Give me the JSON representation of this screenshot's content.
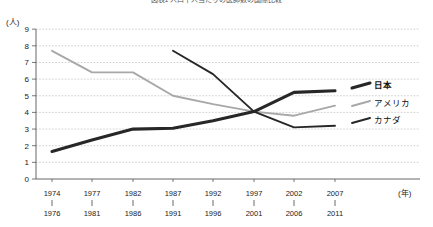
{
  "title": "図表1 人口千人当たりの医師数の国際比較",
  "axis": {
    "y_unit": "(人)",
    "x_unit": "(年)",
    "y_ticks": [
      "0",
      "1",
      "2",
      "3",
      "4",
      "5",
      "6",
      "7",
      "8",
      "9"
    ]
  },
  "legend": {
    "items": [
      {
        "label": "日本",
        "color": "#272727",
        "weight": "bold"
      },
      {
        "label": "アメリカ",
        "color": "#a8a8a8",
        "weight": "normal"
      },
      {
        "label": "カナダ",
        "color": "#272727",
        "weight": "normal"
      }
    ]
  },
  "chart_data": {
    "type": "line",
    "title": "図表1 人口千人当たりの医師数の国際比較",
    "xlabel": "(年)",
    "ylabel": "(人)",
    "ylim": [
      0,
      9
    ],
    "grid": true,
    "legend_position": "right",
    "categories": [
      "1974\n1976",
      "1977\n1981",
      "1982\n1986",
      "1987\n1991",
      "1992\n1996",
      "1997\n2001",
      "2002\n2006",
      "2007\n2011"
    ],
    "category_top": [
      "1974",
      "1977",
      "1982",
      "1987",
      "1992",
      "1997",
      "2002",
      "2007"
    ],
    "category_bottom": [
      "1976",
      "1981",
      "1986",
      "1991",
      "1996",
      "2001",
      "2006",
      "2011"
    ],
    "series": [
      {
        "name": "日本",
        "color": "#272727",
        "values": [
          1.65,
          2.35,
          3.0,
          3.05,
          3.5,
          4.05,
          5.2,
          5.3
        ]
      },
      {
        "name": "アメリカ",
        "color": "#a8a8a8",
        "values": [
          7.7,
          6.4,
          6.4,
          5.0,
          4.5,
          4.05,
          3.8,
          4.4
        ]
      },
      {
        "name": "カナダ",
        "color": "#272727",
        "values": [
          null,
          null,
          null,
          7.7,
          6.3,
          4.05,
          3.1,
          3.2
        ]
      }
    ]
  }
}
